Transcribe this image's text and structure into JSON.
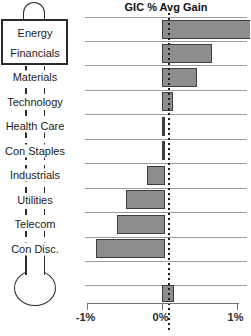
{
  "chart": {
    "title": "GIC % Avg Gain"
  },
  "thermometer": {
    "box_labels": [
      "Energy",
      "Financials"
    ],
    "stem_labels": [
      "Materials",
      "Technology",
      "Health Care",
      "Con Staples",
      "Industrials",
      "Utilities",
      "Telecom",
      "Con Disc."
    ]
  },
  "chart_data": {
    "type": "bar",
    "orientation": "horizontal",
    "title": "GIC % Avg Gain",
    "unit": "%",
    "categories": [
      "Energy",
      "Financials",
      "Materials",
      "Technology",
      "Health Care",
      "Con Staples",
      "Industrials",
      "Utilities",
      "Telecom",
      "Con Disc."
    ],
    "values": [
      1.15,
      0.63,
      0.43,
      0.11,
      0.0,
      0.0,
      -0.2,
      -0.48,
      -0.6,
      -0.88
    ],
    "energy_bar_clipped_at_right_edge": true,
    "bottom_unlabeled_bar": 0.12,
    "dotted_reference_line": 0.1,
    "xlim": [
      -1,
      1
    ],
    "x_tick_values": [
      -1,
      0,
      1
    ],
    "x_tick_labels": [
      "-1%",
      "0%",
      "1%"
    ],
    "grid": true,
    "legend": "none"
  },
  "colors": {
    "bar_fill": "#8d8d8d",
    "bar_border": "#3d3d3d",
    "gridline": "#9b9b9b",
    "axis": "#757575",
    "thermometer_outline": "#2b2b2b",
    "text": "#1b1b1b",
    "background": "#ffffff"
  }
}
